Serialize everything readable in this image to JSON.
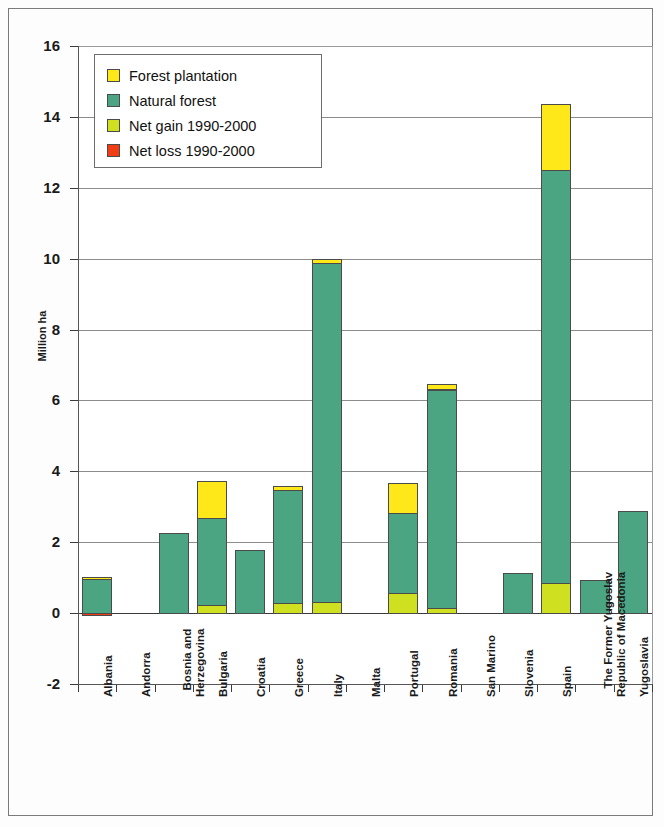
{
  "chart_data": {
    "type": "bar",
    "title": "",
    "xlabel": "",
    "ylabel": "Million ha",
    "ylim": [
      -2,
      16
    ],
    "yticks": [
      16,
      14,
      12,
      10,
      8,
      6,
      4,
      2,
      0,
      -2
    ],
    "ytick_labels": [
      "16",
      "14",
      "12",
      "10",
      "8",
      "6",
      "4",
      "2",
      "0",
      "-2"
    ],
    "grid": true,
    "stacked": true,
    "legend_position": "upper-left-inside",
    "categories": [
      "Albania",
      "Andorra",
      "Bosnia and Herzegovina",
      "Bulgaria",
      "Croatia",
      "Greece",
      "Italy",
      "Malta",
      "Portugal",
      "Romania",
      "San Marino",
      "Slovenia",
      "Spain",
      "The Former Yugoslav Republic of Macedonia",
      "Yugoslavia"
    ],
    "category_lines": [
      [
        "Albania"
      ],
      [
        "Andorra"
      ],
      [
        "Bosnia and",
        "Herzegovina"
      ],
      [
        "Bulgaria"
      ],
      [
        "Croatia"
      ],
      [
        "Greece"
      ],
      [
        "Italy"
      ],
      [
        "Malta"
      ],
      [
        "Portugal"
      ],
      [
        "Romania"
      ],
      [
        "San Marino"
      ],
      [
        "Slovenia"
      ],
      [
        "Spain"
      ],
      [
        "The Former Yugoslav",
        "Republic of Macedonia"
      ],
      [
        "Yugoslavia"
      ]
    ],
    "series": [
      {
        "name": "Net gain 1990-2000",
        "color": "#cfe020",
        "values": [
          0,
          0,
          0,
          0.22,
          0,
          0.29,
          0.3,
          0,
          0.57,
          0.15,
          0,
          0,
          0.86,
          0,
          0
        ]
      },
      {
        "name": "Natural forest",
        "color": "#4ba583",
        "values": [
          0.95,
          0,
          2.27,
          2.48,
          1.79,
          3.19,
          9.6,
          0,
          2.25,
          6.15,
          0,
          1.14,
          11.64,
          0.94,
          2.89
        ]
      },
      {
        "name": "Forest plantation",
        "color": "#ffe81a",
        "values": [
          0.06,
          0,
          0,
          1.03,
          0,
          0.12,
          0.1,
          0,
          0.85,
          0.15,
          0,
          0,
          1.85,
          0,
          0
        ]
      },
      {
        "name": "Net loss 1990-2000",
        "color": "#f03d16",
        "values": [
          -0.08,
          0,
          0,
          0,
          0,
          0,
          0,
          0,
          0,
          0,
          0,
          0,
          0,
          0,
          0
        ]
      }
    ],
    "totals": [
      1.01,
      0,
      2.27,
      3.73,
      1.79,
      3.6,
      10.0,
      0,
      3.67,
      6.45,
      0,
      1.14,
      14.35,
      0.94,
      2.89
    ]
  },
  "legend": {
    "items": [
      {
        "label": "Forest plantation",
        "color": "#ffe81a"
      },
      {
        "label": "Natural forest",
        "color": "#4ba583"
      },
      {
        "label": "Net gain 1990-2000",
        "color": "#cfe020"
      },
      {
        "label": "Net loss 1990-2000",
        "color": "#f03d16"
      }
    ]
  }
}
